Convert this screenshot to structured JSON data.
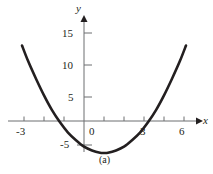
{
  "figure": {
    "caption": "(a)",
    "axis_labels": {
      "x": "x",
      "y": "y"
    },
    "colors": {
      "curve": "#231f20",
      "axis": "#6d6e71",
      "text": "#231f20",
      "background": "#ffffff"
    }
  },
  "chart_data": {
    "type": "line",
    "title": "",
    "subtitle": "",
    "xlabel": "x",
    "ylabel": "y",
    "xlim": [
      -3.6,
      6.4
    ],
    "ylim": [
      -6.5,
      17.5
    ],
    "grid": false,
    "legend": null,
    "annotations": [
      "(a)"
    ],
    "xticks": [
      -3,
      -2,
      -1,
      0,
      1,
      2,
      3,
      4,
      5,
      6
    ],
    "xtick_labels": [
      "-3",
      "",
      "",
      "0",
      "",
      "",
      "3",
      "",
      "",
      "6"
    ],
    "yticks": [
      -5,
      5,
      10,
      15
    ],
    "ytick_labels": [
      "-5",
      "5",
      "10",
      "15"
    ],
    "series": [
      {
        "name": "parabola",
        "equation": "y = x^2 - 2x - 4",
        "x": [
          -3.1,
          -2.8,
          -2.4,
          -2.0,
          -1.6,
          -1.2,
          -0.8,
          -0.4,
          0.0,
          0.4,
          0.8,
          1.0,
          1.2,
          1.6,
          2.0,
          2.4,
          2.8,
          3.2,
          3.6,
          4.0,
          4.4,
          4.8,
          5.1
        ],
        "values": [
          11.8,
          9.4,
          6.6,
          4.0,
          1.7,
          -0.2,
          -1.8,
          -3.0,
          -4.0,
          -4.6,
          -4.96,
          -5.0,
          -4.96,
          -4.6,
          -4.0,
          -3.0,
          -1.8,
          -0.2,
          1.7,
          4.0,
          6.6,
          9.4,
          11.8
        ]
      }
    ],
    "roots": [
      -1.24,
      3.24
    ],
    "vertex": {
      "x": 1.0,
      "y": -5.0
    }
  }
}
